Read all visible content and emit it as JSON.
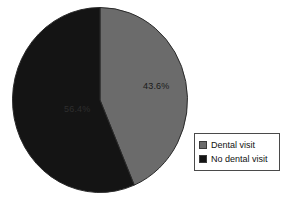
{
  "chart_data": {
    "type": "pie",
    "title": "",
    "subtitle": "",
    "xlabel": "",
    "ylabel": "",
    "grid": false,
    "legend_position": "right-bottom",
    "start_angle_deg": 0,
    "direction": "clockwise",
    "categories": [
      "Dental visit",
      "No dental visit"
    ],
    "values": [
      43.6,
      56.4
    ],
    "slices": [
      {
        "label": "Dental visit",
        "value": 43.6,
        "data_label": "43.6%",
        "color": "#6b6b6b",
        "swatch_color": "#6b6b6b"
      },
      {
        "label": "No dental visit",
        "value": 56.4,
        "data_label": "56.4%",
        "color": "#141414",
        "swatch_color": "#141414"
      }
    ]
  },
  "legend": {
    "items": [
      {
        "label": "Dental visit",
        "swatch": "legend-swatch-gray"
      },
      {
        "label": "No dental visit",
        "swatch": "legend-swatch-black"
      }
    ]
  },
  "colors": {
    "background": "#ffffff",
    "slice_gray": "#6b6b6b",
    "slice_black": "#141414",
    "pie_outline": "#2a2a2a",
    "legend_border": "#4a4a4a",
    "text": "#111111"
  }
}
